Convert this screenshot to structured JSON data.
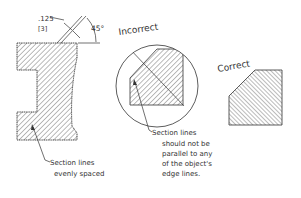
{
  "diagram": {
    "left": {
      "dimension_value": ".125",
      "dimension_metric": "[3]",
      "angle_label": "45°",
      "note_line1": "Section lines",
      "note_line2": "evenly spaced"
    },
    "incorrect": {
      "title": "Incorrect",
      "note_line1": "Section lines",
      "note_line2": "should not be",
      "note_line3": "parallel to any",
      "note_line4": "of the object's",
      "note_line5": "edge lines."
    },
    "correct": {
      "title": "Correct"
    },
    "colors": {
      "line": "#333333",
      "hatch": "#555555",
      "background": "#ffffff"
    }
  }
}
